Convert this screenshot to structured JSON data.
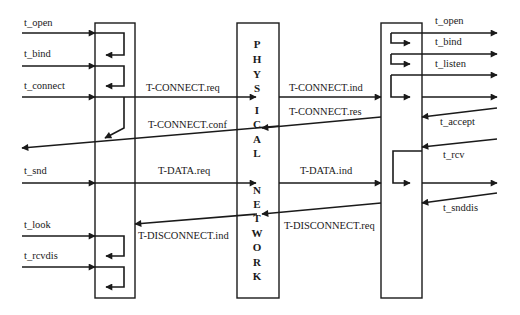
{
  "diagram": {
    "type": "protocol-sequence",
    "colors": {
      "ink": "#1a1a1a",
      "background": "#ffffff"
    },
    "boxes": {
      "left": {
        "role": "client-transport-provider"
      },
      "center": {
        "label_letters": [
          "P",
          "H",
          "Y",
          "S",
          "I",
          "C",
          "A",
          "L",
          "N",
          "E",
          "T",
          "W",
          "O",
          "R",
          "K"
        ],
        "label": "PHYSICAL NETWORK"
      },
      "right": {
        "role": "server-transport-provider"
      }
    },
    "left_calls": {
      "t_open": "t_open",
      "t_bind": "t_bind",
      "t_connect": "t_connect",
      "t_snd": "t_snd",
      "t_look": "t_look",
      "t_rcvdis": "t_rcvdis"
    },
    "right_calls": {
      "t_open": "t_open",
      "t_bind": "t_bind",
      "t_listen": "t_listen",
      "t_accept": "t_accept",
      "t_rcv": "t_rcv",
      "t_snddis": "t_snddis"
    },
    "primitives": {
      "connect_req": "T-CONNECT.req",
      "connect_ind": "T-CONNECT.ind",
      "connect_res": "T-CONNECT.res",
      "connect_conf": "T-CONNECT.conf",
      "data_req": "T-DATA.req",
      "data_ind": "T-DATA.ind",
      "disconnect_req": "T-DISCONNECT.req",
      "disconnect_ind": "T-DISCONNECT.ind"
    }
  }
}
